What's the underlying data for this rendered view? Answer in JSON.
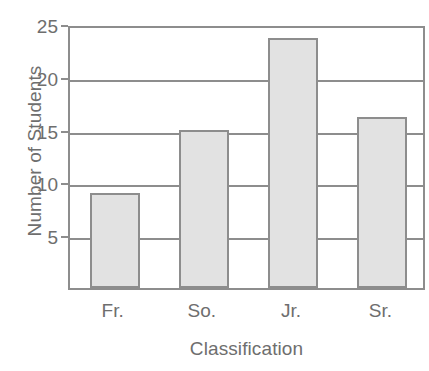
{
  "chart_data": {
    "type": "bar",
    "title": "",
    "xlabel": "Classification",
    "ylabel": "Number of Students",
    "categories": [
      "Fr.",
      "So.",
      "Jr.",
      "Sr."
    ],
    "values": [
      9,
      15,
      23.7,
      16.2
    ],
    "series": [
      {
        "name": "Number of Students",
        "values": [
          9,
          15,
          23.7,
          16.2
        ]
      }
    ],
    "ylim": [
      0,
      25
    ],
    "yticks": [
      5,
      10,
      15,
      20,
      25
    ],
    "ytick_labels": [
      "5",
      "10",
      "15",
      "20",
      "25"
    ],
    "grid": "horizontal",
    "legend": "none",
    "bar_fill_color": "#e2e2e2",
    "bar_edge_color": "#8d8d8d",
    "axis_color": "#8d8d8d",
    "text_color": "#6e6e6e",
    "background_color": "#ffffff"
  }
}
